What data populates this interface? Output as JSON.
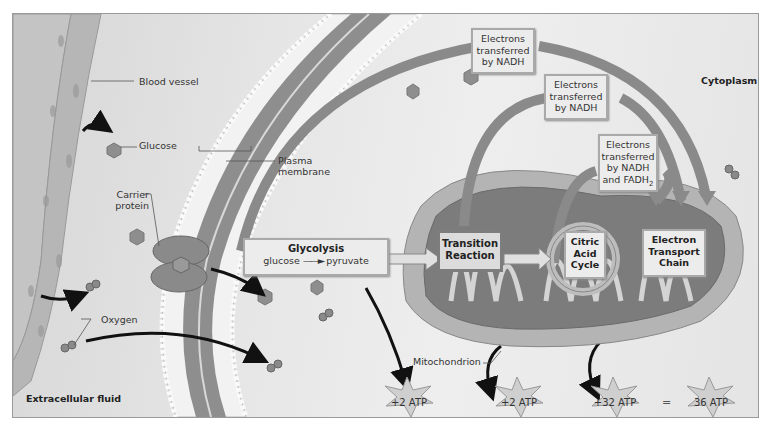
{
  "labels": {
    "blood_vessel": "Blood vessel",
    "glucose": "Glucose",
    "carrier_protein": "Carrier protein",
    "plasma_membrane": "Plasma membrane",
    "oxygen": "Oxygen",
    "extracellular_fluid": "Extracellular fluid",
    "cytoplasm": "Cytoplasm",
    "mitochondrion": "Mitochondrion"
  },
  "glycolysis": {
    "title": "Glycolysis",
    "from": "glucose",
    "to": "pyruvate"
  },
  "stages": {
    "transition": "Transition Reaction",
    "citric": "Citric Acid Cycle",
    "etc": "Electron Transport Chain"
  },
  "electron_boxes": [
    {
      "line1": "Electrons",
      "line2": "transferred",
      "line3": "by NADH"
    },
    {
      "line1": "Electrons",
      "line2": "transferred",
      "line3": "by NADH"
    },
    {
      "line1": "Electrons",
      "line2": "transferred",
      "line3": "by NADH",
      "line4": "and FADH",
      "sub": "2"
    }
  ],
  "atp": {
    "glycolysis": "+2 ATP",
    "citric": "+2 ATP",
    "etc": "+32 ATP",
    "equals": "=",
    "total": "36 ATP"
  },
  "colors": {
    "arrow": "#8a8a8a",
    "box_fill": "#ececec",
    "dark_box": "#dcdcdc",
    "molecule": "#8e8e8e",
    "atp_star": "#cfcfcf"
  }
}
